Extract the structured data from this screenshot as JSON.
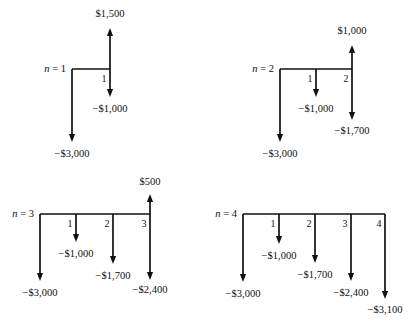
{
  "figure": {
    "background_color": "#ffffff",
    "ink_color": "#111111",
    "currency_symbol": "$",
    "negative_prefix": "−"
  },
  "chart_data": {
    "type": "diagram",
    "subtype": "cash-flow-diagram",
    "xlabel": "Period (end of year)",
    "ylabel": "Cash flow",
    "grid": false,
    "legend": false,
    "convention": "Upward arrows are positive cash inflows; downward arrows are negative cash outflows.",
    "panels": [
      {
        "id": "n1",
        "label": "n = 1",
        "n_symbol": "n",
        "n_value": "1",
        "periods": [
          "1"
        ],
        "x": [
          0,
          1
        ],
        "values": [
          -3000,
          500
        ],
        "flows": [
          {
            "period": "0",
            "label": "−$3,000",
            "value": -3000,
            "direction": "down",
            "depth": "long"
          },
          {
            "period": "1",
            "label": "$1,500",
            "value": 1500,
            "direction": "up",
            "depth": "short"
          },
          {
            "period": "1",
            "label": "−$1,000",
            "value": -1000,
            "direction": "down",
            "depth": "short"
          }
        ]
      },
      {
        "id": "n2",
        "label": "n = 2",
        "n_symbol": "n",
        "n_value": "2",
        "periods": [
          "1",
          "2"
        ],
        "x": [
          0,
          1,
          2
        ],
        "values": [
          -3000,
          -1000,
          -700
        ],
        "flows": [
          {
            "period": "0",
            "label": "−$3,000",
            "value": -3000,
            "direction": "down",
            "depth": "long"
          },
          {
            "period": "1",
            "label": "−$1,000",
            "value": -1000,
            "direction": "down",
            "depth": "short"
          },
          {
            "period": "2",
            "label": "$1,000",
            "value": 1000,
            "direction": "up",
            "depth": "short"
          },
          {
            "period": "2",
            "label": "−$1,700",
            "value": -1700,
            "direction": "down",
            "depth": "medium"
          }
        ]
      },
      {
        "id": "n3",
        "label": "n = 3",
        "n_symbol": "n",
        "n_value": "3",
        "periods": [
          "1",
          "2",
          "3"
        ],
        "x": [
          0,
          1,
          2,
          3
        ],
        "values": [
          -3000,
          -1000,
          -1700,
          -1900
        ],
        "flows": [
          {
            "period": "0",
            "label": "−$3,000",
            "value": -3000,
            "direction": "down",
            "depth": "long"
          },
          {
            "period": "1",
            "label": "−$1,000",
            "value": -1000,
            "direction": "down",
            "depth": "short"
          },
          {
            "period": "2",
            "label": "−$1,700",
            "value": -1700,
            "direction": "down",
            "depth": "medium"
          },
          {
            "period": "3",
            "label": "$500",
            "value": 500,
            "direction": "up",
            "depth": "short"
          },
          {
            "period": "3",
            "label": "−$2,400",
            "value": -2400,
            "direction": "down",
            "depth": "long"
          }
        ]
      },
      {
        "id": "n4",
        "label": "n = 4",
        "n_symbol": "n",
        "n_value": "4",
        "periods": [
          "1",
          "2",
          "3",
          "4"
        ],
        "x": [
          0,
          1,
          2,
          3,
          4
        ],
        "values": [
          -3000,
          -1000,
          -1700,
          -2400,
          -3100
        ],
        "flows": [
          {
            "period": "0",
            "label": "−$3,000",
            "value": -3000,
            "direction": "down",
            "depth": "long"
          },
          {
            "period": "1",
            "label": "−$1,000",
            "value": -1000,
            "direction": "down",
            "depth": "short"
          },
          {
            "period": "2",
            "label": "−$1,700",
            "value": -1700,
            "direction": "down",
            "depth": "medium"
          },
          {
            "period": "3",
            "label": "−$2,400",
            "value": -2400,
            "direction": "down",
            "depth": "long"
          },
          {
            "period": "4",
            "label": "−$3,100",
            "value": -3100,
            "direction": "down",
            "depth": "longer"
          }
        ]
      }
    ]
  },
  "geometry": {
    "panels": [
      {
        "id": "n1",
        "baseline_y": 69,
        "baseline_x0": 72,
        "baseline_x1": 110,
        "tick_spacing": 38,
        "n_label_x": 66,
        "n_label_y": 72,
        "ticks": [
          {
            "x": 110,
            "label": "1",
            "label_x": 104,
            "label_y": 82
          }
        ],
        "arrows": [
          {
            "name": "flow-arrow-n0-down",
            "x": 72,
            "y0": 69,
            "y1": 142,
            "dir": "down",
            "label": "−$3,000",
            "label_x": 72,
            "label_y": 157,
            "anchor": "middle"
          },
          {
            "name": "flow-arrow-p1-up",
            "x": 110,
            "y0": 69,
            "y1": 28,
            "dir": "up",
            "label": "$1,500",
            "label_x": 110,
            "label_y": 17,
            "anchor": "middle"
          },
          {
            "name": "flow-arrow-p1-down",
            "x": 110,
            "y0": 69,
            "y1": 97,
            "dir": "down",
            "label": "−$1,000",
            "label_x": 110,
            "label_y": 112,
            "anchor": "middle"
          }
        ]
      },
      {
        "id": "n2",
        "baseline_y": 69,
        "baseline_x0": 280,
        "baseline_x1": 352,
        "tick_spacing": 36,
        "n_label_x": 274,
        "n_label_y": 72,
        "ticks": [
          {
            "x": 316,
            "label": "1",
            "label_x": 310,
            "label_y": 82
          },
          {
            "x": 352,
            "label": "2",
            "label_x": 346,
            "label_y": 82
          }
        ],
        "arrows": [
          {
            "name": "flow-arrow-n0-down",
            "x": 280,
            "y0": 69,
            "y1": 142,
            "dir": "down",
            "label": "−$3,000",
            "label_x": 280,
            "label_y": 157,
            "anchor": "middle"
          },
          {
            "name": "flow-arrow-p1-down",
            "x": 316,
            "y0": 69,
            "y1": 97,
            "dir": "down",
            "label": "−$1,000",
            "label_x": 316,
            "label_y": 112,
            "anchor": "middle"
          },
          {
            "name": "flow-arrow-p2-up",
            "x": 352,
            "y0": 69,
            "y1": 45,
            "dir": "up",
            "label": "$1,000",
            "label_x": 352,
            "label_y": 34,
            "anchor": "middle"
          },
          {
            "name": "flow-arrow-p2-down",
            "x": 352,
            "y0": 69,
            "y1": 120,
            "dir": "down",
            "label": "−$1,700",
            "label_x": 352,
            "label_y": 134,
            "anchor": "middle"
          }
        ]
      },
      {
        "id": "n3",
        "baseline_y": 214,
        "baseline_x0": 40,
        "baseline_x1": 150,
        "tick_spacing": 37,
        "n_label_x": 34,
        "n_label_y": 217,
        "ticks": [
          {
            "x": 76,
            "label": "1",
            "label_x": 70,
            "label_y": 227
          },
          {
            "x": 113,
            "label": "2",
            "label_x": 107,
            "label_y": 227
          },
          {
            "x": 150,
            "label": "3",
            "label_x": 144,
            "label_y": 227
          }
        ],
        "arrows": [
          {
            "name": "flow-arrow-n0-down",
            "x": 40,
            "y0": 214,
            "y1": 281,
            "dir": "down",
            "label": "−$3,000",
            "label_x": 40,
            "label_y": 296,
            "anchor": "middle"
          },
          {
            "name": "flow-arrow-p1-down",
            "x": 76,
            "y0": 214,
            "y1": 242,
            "dir": "down",
            "label": "−$1,000",
            "label_x": 76,
            "label_y": 257,
            "anchor": "middle"
          },
          {
            "name": "flow-arrow-p2-down",
            "x": 113,
            "y0": 214,
            "y1": 264,
            "dir": "down",
            "label": "−$1,700",
            "label_x": 113,
            "label_y": 279,
            "anchor": "middle"
          },
          {
            "name": "flow-arrow-p3-up",
            "x": 150,
            "y0": 214,
            "y1": 194,
            "dir": "up",
            "label": "$500",
            "label_x": 150,
            "label_y": 185,
            "anchor": "middle"
          },
          {
            "name": "flow-arrow-p3-down",
            "x": 150,
            "y0": 214,
            "y1": 280,
            "dir": "down",
            "label": "−$2,400",
            "label_x": 150,
            "label_y": 293,
            "anchor": "middle"
          }
        ]
      },
      {
        "id": "n4",
        "baseline_y": 214,
        "baseline_x0": 243,
        "baseline_x1": 385,
        "tick_spacing": 36,
        "n_label_x": 237,
        "n_label_y": 217,
        "ticks": [
          {
            "x": 279,
            "label": "1",
            "label_x": 273,
            "label_y": 227
          },
          {
            "x": 315,
            "label": "2",
            "label_x": 309,
            "label_y": 227
          },
          {
            "x": 351,
            "label": "3",
            "label_x": 345,
            "label_y": 227
          },
          {
            "x": 385,
            "label": "4",
            "label_x": 379,
            "label_y": 227
          }
        ],
        "arrows": [
          {
            "name": "flow-arrow-n0-down",
            "x": 243,
            "y0": 214,
            "y1": 282,
            "dir": "down",
            "label": "−$3,000",
            "label_x": 243,
            "label_y": 297,
            "anchor": "middle"
          },
          {
            "name": "flow-arrow-p1-down",
            "x": 279,
            "y0": 214,
            "y1": 244,
            "dir": "down",
            "label": "−$1,000",
            "label_x": 279,
            "label_y": 259,
            "anchor": "middle"
          },
          {
            "name": "flow-arrow-p2-down",
            "x": 315,
            "y0": 214,
            "y1": 263,
            "dir": "down",
            "label": "−$1,700",
            "label_x": 315,
            "label_y": 278,
            "anchor": "middle"
          },
          {
            "name": "flow-arrow-p3-down",
            "x": 351,
            "y0": 214,
            "y1": 281,
            "dir": "down",
            "label": "−$2,400",
            "label_x": 351,
            "label_y": 296,
            "anchor": "middle"
          },
          {
            "name": "flow-arrow-p4-down",
            "x": 385,
            "y0": 214,
            "y1": 299,
            "dir": "down",
            "label": "−$3,100",
            "label_x": 385,
            "label_y": 313,
            "anchor": "middle"
          }
        ]
      }
    ]
  }
}
